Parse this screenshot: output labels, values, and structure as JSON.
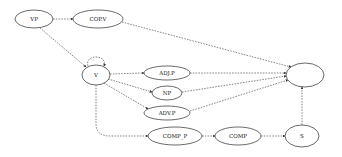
{
  "diagram": {
    "type": "directed-graph",
    "edge_style": "dashed",
    "colors": {
      "stroke": "#444444",
      "edge": "#555555",
      "background": "#ffffff",
      "text": "#222222"
    },
    "nodes": [
      {
        "id": "VP",
        "label": "VP",
        "cx": 34,
        "cy": 19,
        "rx": 19,
        "ry": 9
      },
      {
        "id": "COPV",
        "label": "COP.V",
        "cx": 98,
        "cy": 19,
        "rx": 25,
        "ry": 9
      },
      {
        "id": "V",
        "label": "V",
        "cx": 96,
        "cy": 75,
        "rx": 14,
        "ry": 10
      },
      {
        "id": "ADJP",
        "label": "ADJ.P",
        "cx": 167,
        "cy": 73,
        "rx": 23,
        "ry": 7
      },
      {
        "id": "NP",
        "label": "NP",
        "cx": 167,
        "cy": 93,
        "rx": 15,
        "ry": 7
      },
      {
        "id": "ADVP",
        "label": "ADV.P",
        "cx": 167,
        "cy": 113,
        "rx": 23,
        "ry": 7
      },
      {
        "id": "COMPP",
        "label": "COMP_P",
        "cx": 175,
        "cy": 136,
        "rx": 27,
        "ry": 9
      },
      {
        "id": "COMP",
        "label": "COMP",
        "cx": 238,
        "cy": 136,
        "rx": 23,
        "ry": 9
      },
      {
        "id": "S",
        "label": "S",
        "cx": 302,
        "cy": 136,
        "rx": 17,
        "ry": 11
      },
      {
        "id": "TARGET",
        "label": "",
        "cx": 305,
        "cy": 75,
        "rx": 19,
        "ry": 12
      }
    ],
    "edges": [
      {
        "from": "VP",
        "to": "COPV",
        "path": "M53,19 L73,19"
      },
      {
        "from": "VP",
        "to": "V",
        "path": "M40,28 L86,67"
      },
      {
        "from": "V",
        "to": "V",
        "label": "self-loop",
        "path": "M88,66 C84,54 108,54 104,66"
      },
      {
        "from": "COPV",
        "to": "TARGET",
        "path": "M122,22 L291,67"
      },
      {
        "from": "V",
        "to": "ADJP",
        "path": "M110,74 L144,73"
      },
      {
        "from": "V",
        "to": "NP",
        "path": "M108,79 L152,92"
      },
      {
        "from": "V",
        "to": "ADVP",
        "path": "M104,83 L148,109"
      },
      {
        "from": "V",
        "to": "COMPP",
        "path": "M96,85 L96,124 Q96,136 110,136 L148,136"
      },
      {
        "from": "ADJP",
        "to": "TARGET",
        "path": "M190,73 L286,73"
      },
      {
        "from": "NP",
        "to": "TARGET",
        "path": "M182,92 L286,76"
      },
      {
        "from": "ADVP",
        "to": "TARGET",
        "path": "M190,111 L288,80"
      },
      {
        "from": "COMPP",
        "to": "COMP",
        "path": "M202,136 L215,136"
      },
      {
        "from": "COMP",
        "to": "S",
        "path": "M261,136 L285,136"
      },
      {
        "from": "S",
        "to": "TARGET",
        "path": "M302,125 L302,87"
      }
    ],
    "arrowheads": [
      {
        "edge": "VP-COPV",
        "x": 73,
        "y": 19,
        "dir": "right"
      },
      {
        "edge": "VP-V",
        "x": 86,
        "y": 67,
        "dir": "down-right"
      },
      {
        "edge": "V-V",
        "x": 104,
        "y": 66,
        "dir": "down"
      },
      {
        "edge": "COPV-TARGET",
        "x": 291,
        "y": 67,
        "dir": "right"
      },
      {
        "edge": "ADJP-TARGET",
        "x": 286,
        "y": 73,
        "dir": "right"
      },
      {
        "edge": "NP-TARGET",
        "x": 286,
        "y": 76,
        "dir": "right"
      },
      {
        "edge": "ADVP-TARGET",
        "x": 288,
        "y": 80,
        "dir": "right"
      },
      {
        "edge": "COMPP-COMP",
        "x": 215,
        "y": 136,
        "dir": "right"
      },
      {
        "edge": "S-TARGET",
        "x": 302,
        "y": 87,
        "dir": "up"
      }
    ]
  }
}
